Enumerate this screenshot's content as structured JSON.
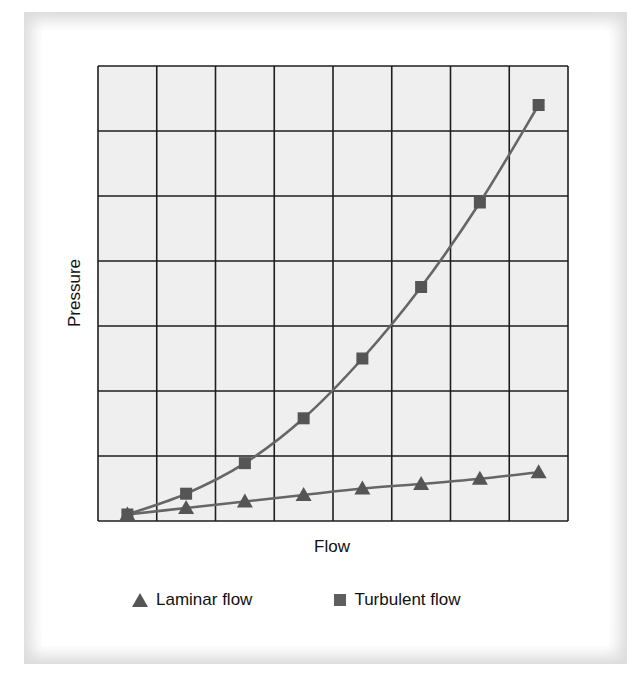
{
  "chart_data": {
    "type": "line",
    "title": "",
    "xlabel": "Flow",
    "ylabel": "Pressure",
    "x": [
      0.5,
      1.5,
      2.5,
      3.5,
      4.5,
      5.5,
      6.5,
      7.5
    ],
    "xlim": [
      0,
      8
    ],
    "ylim": [
      0,
      7
    ],
    "grid": true,
    "grid_columns": 8,
    "grid_rows": 7,
    "tick_labels_shown": false,
    "legend_position": "bottom",
    "series": [
      {
        "name": "Laminar flow",
        "marker": "triangle",
        "values": [
          0.1,
          0.2,
          0.3,
          0.4,
          0.5,
          0.57,
          0.65,
          0.75
        ]
      },
      {
        "name": "Turbulent flow",
        "marker": "square",
        "values": [
          0.1,
          0.42,
          0.89,
          1.58,
          2.5,
          3.6,
          4.9,
          6.4
        ]
      }
    ]
  },
  "colors": {
    "grid_line": "#1e1e1e",
    "plot_bg": "#efefef",
    "series_line": "#666666",
    "marker": "#555555"
  },
  "legend": {
    "laminar": "Laminar flow",
    "turbulent": "Turbulent flow"
  }
}
